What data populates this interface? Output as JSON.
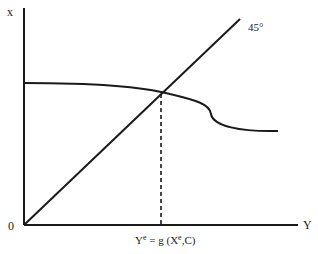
{
  "diagram": {
    "y_axis_label": "x",
    "x_axis_label": "Y",
    "origin_label": "0",
    "line_label": "45°",
    "equilibrium_label": {
      "base": "Y",
      "sup1": "e",
      "mid": " = g (X",
      "sup2": "e",
      "end": ",C)"
    },
    "colors": {
      "line": "#1a1a1a",
      "background": "#ffffff"
    }
  }
}
